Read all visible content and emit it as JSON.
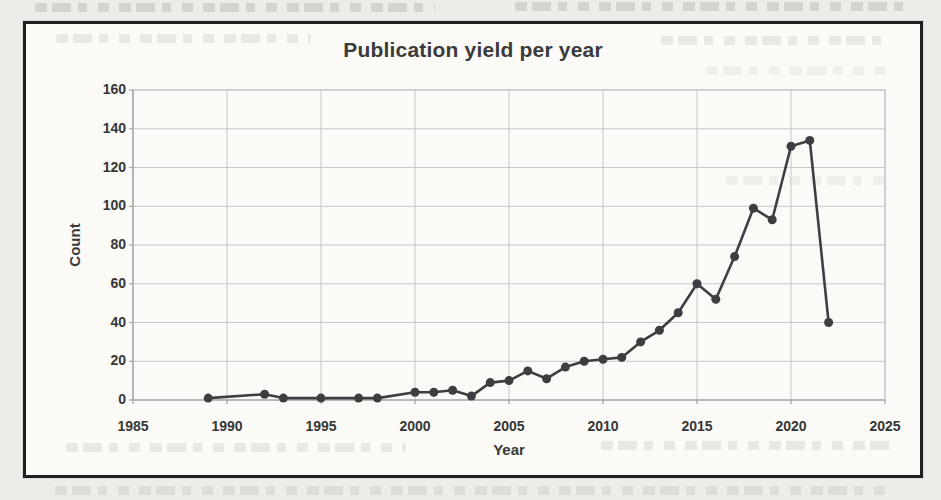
{
  "figure": {
    "kind": "scanned line chart figure",
    "frame_border_color": "#1f1f1f",
    "paper_color": "#fbfaf7"
  },
  "chart_data": {
    "type": "line",
    "title": "Publication yield per year",
    "xlabel": "Year",
    "ylabel": "Count",
    "xlim": [
      1985,
      2025
    ],
    "ylim": [
      0,
      160
    ],
    "xticks": [
      1985,
      1990,
      1995,
      2000,
      2005,
      2010,
      2015,
      2020,
      2025
    ],
    "yticks": [
      0,
      20,
      40,
      60,
      80,
      100,
      120,
      140,
      160
    ],
    "grid": true,
    "legend": "none",
    "line_color": "#3e3e42",
    "marker": "filled-circle",
    "series": [
      {
        "name": "Publications per year",
        "points": [
          [
            1989,
            1
          ],
          [
            1992,
            3
          ],
          [
            1993,
            1
          ],
          [
            1995,
            1
          ],
          [
            1997,
            1
          ],
          [
            1998,
            1
          ],
          [
            2000,
            4
          ],
          [
            2001,
            4
          ],
          [
            2002,
            5
          ],
          [
            2003,
            2
          ],
          [
            2004,
            9
          ],
          [
            2005,
            10
          ],
          [
            2006,
            15
          ],
          [
            2007,
            11
          ],
          [
            2008,
            17
          ],
          [
            2009,
            20
          ],
          [
            2010,
            21
          ],
          [
            2011,
            22
          ],
          [
            2012,
            30
          ],
          [
            2013,
            36
          ],
          [
            2014,
            45
          ],
          [
            2015,
            60
          ],
          [
            2016,
            52
          ],
          [
            2017,
            74
          ],
          [
            2018,
            99
          ],
          [
            2019,
            93
          ],
          [
            2020,
            131
          ],
          [
            2021,
            134
          ],
          [
            2022,
            40
          ]
        ]
      }
    ]
  }
}
